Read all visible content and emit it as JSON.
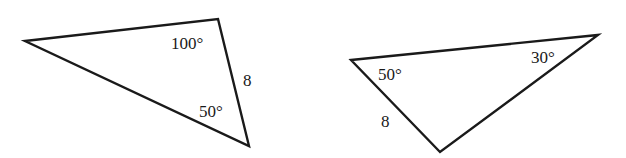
{
  "figure": {
    "stroke_color": "#1a1a1a",
    "background": "#ffffff"
  },
  "triangles": [
    {
      "id": "left",
      "vertices": [
        [
          25,
          41
        ],
        [
          218,
          19
        ],
        [
          249,
          146
        ]
      ],
      "labels": {
        "angle_top": "100°",
        "angle_bottom": "50°",
        "side": "8"
      }
    },
    {
      "id": "right",
      "vertices": [
        [
          351,
          60
        ],
        [
          598,
          35
        ],
        [
          440,
          152
        ]
      ],
      "labels": {
        "angle_left": "50°",
        "angle_right": "30°",
        "side": "8"
      }
    }
  ]
}
